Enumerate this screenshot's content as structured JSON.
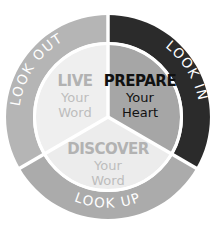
{
  "diagram": {
    "center": [
      108,
      117
    ],
    "outer_ring": [
      {
        "label": "LOOK IN",
        "color": "#2b2b2b",
        "text_color": "#ffffff"
      },
      {
        "label": "LOOK UP",
        "color": "#ababab",
        "text_color": "#ffffff"
      },
      {
        "label": "LOOK OUT",
        "color": "#b5b5b5",
        "text_color": "#ffffff"
      }
    ],
    "slices": [
      {
        "title": "PREPARE",
        "line1": "Your",
        "line2": "Heart",
        "color": "#a6a6a6",
        "title_color": "#111111",
        "sub_color": "#111111"
      },
      {
        "title": "DISCOVER",
        "line1": "Your",
        "line2": "Word",
        "color": "#ececec",
        "title_color": "#b2b2b2",
        "sub_color": "#bdbdbd"
      },
      {
        "title": "LIVE",
        "line1": "Your",
        "line2": "Word",
        "color": "#efefef",
        "title_color": "#b2b2b2",
        "sub_color": "#bdbdbd"
      }
    ]
  }
}
